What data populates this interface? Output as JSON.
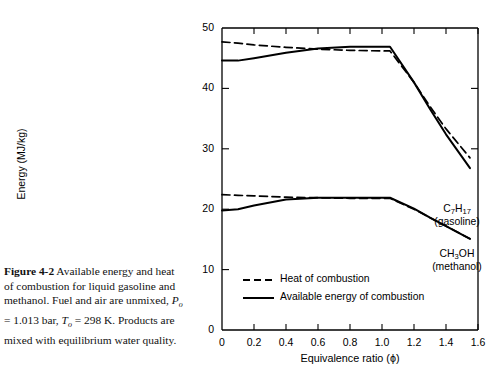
{
  "caption": {
    "figure_number": "Figure 4-2",
    "text_1": "Available energy and heat of combustion for liquid gasoline and methanol. Fuel and air are unmixed,",
    "pressure_symbol": "P",
    "pressure_sub": "o",
    "pressure_value": " = 1.013 bar, ",
    "temperature_symbol": "T",
    "temperature_sub": "o",
    "temperature_value": " = 298 K.",
    "text_2": "Products are mixed with equilibrium water quality."
  },
  "chart_data": {
    "type": "line",
    "title": "",
    "xlabel": "Equivalence ratio (ϕ)",
    "ylabel": "Energy (MJ/kg)",
    "xlim": [
      0,
      1.6
    ],
    "ylim": [
      0,
      50
    ],
    "xticks": [
      "0",
      "0.2",
      "0.4",
      "0.6",
      "0.8",
      "1.0",
      "1.2",
      "1.4",
      "1.6"
    ],
    "xtick_values": [
      0,
      0.2,
      0.4,
      0.6,
      0.8,
      1.0,
      1.2,
      1.4,
      1.6
    ],
    "yticks": [
      "0",
      "10",
      "20",
      "30",
      "40",
      "50"
    ],
    "ytick_values": [
      0,
      10,
      20,
      30,
      40,
      50
    ],
    "grid": false,
    "legend_position": "bottom-center-inside",
    "legend": [
      {
        "label": "Heat of combustion",
        "style": "dashed"
      },
      {
        "label": "Available energy of combustion",
        "style": "solid"
      }
    ],
    "annotations": [
      {
        "name": "gasoline-label",
        "line1": "C7H17",
        "line2": "(gasoline)",
        "x": 1.52,
        "y": 33.5
      },
      {
        "name": "methanol-label",
        "line1": "CH3OH",
        "line2": "(methanol)",
        "x": 1.52,
        "y": 17.0
      }
    ],
    "series": [
      {
        "name": "Heat of combustion - gasoline",
        "fuel": "C7H17 (gasoline)",
        "style": "dashed",
        "x": [
          0.0,
          0.1,
          0.2,
          0.4,
          0.6,
          0.8,
          1.0,
          1.05,
          1.2,
          1.3,
          1.4,
          1.55
        ],
        "y": [
          47.7,
          47.5,
          47.2,
          46.8,
          46.5,
          46.3,
          46.2,
          46.2,
          41.0,
          37.0,
          33.3,
          28.5
        ]
      },
      {
        "name": "Available energy of combustion - gasoline",
        "fuel": "C7H17 (gasoline)",
        "style": "solid",
        "x": [
          0.0,
          0.1,
          0.2,
          0.4,
          0.6,
          0.8,
          1.0,
          1.05,
          1.2,
          1.3,
          1.4,
          1.55
        ],
        "y": [
          44.6,
          44.6,
          45.0,
          45.9,
          46.6,
          46.9,
          46.9,
          46.9,
          41.0,
          36.6,
          32.4,
          26.8
        ]
      },
      {
        "name": "Heat of combustion - methanol",
        "fuel": "CH3OH (methanol)",
        "style": "dashed",
        "x": [
          0.0,
          0.1,
          0.2,
          0.4,
          0.6,
          0.8,
          1.0,
          1.05,
          1.2,
          1.3,
          1.4,
          1.55
        ],
        "y": [
          22.4,
          22.3,
          22.2,
          22.0,
          21.9,
          21.8,
          21.8,
          21.8,
          20.0,
          18.6,
          17.2,
          15.1
        ]
      },
      {
        "name": "Available energy of combustion - methanol",
        "fuel": "CH3OH (methanol)",
        "style": "solid",
        "x": [
          0.0,
          0.1,
          0.2,
          0.4,
          0.6,
          0.8,
          1.0,
          1.05,
          1.2,
          1.3,
          1.4,
          1.55
        ],
        "y": [
          19.8,
          20.0,
          20.6,
          21.6,
          21.9,
          21.9,
          21.9,
          21.9,
          20.1,
          18.6,
          17.2,
          15.1
        ]
      }
    ]
  }
}
